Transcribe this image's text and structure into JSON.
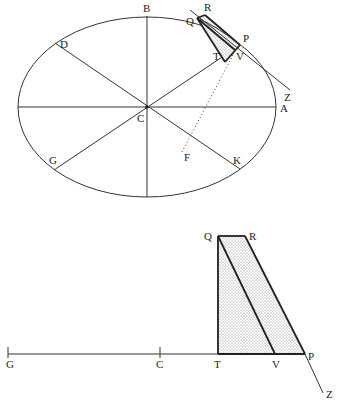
{
  "figure_top": {
    "title": "Ellipse with conjugate diameters and tangent construction",
    "labels": {
      "B": "B",
      "D": "D",
      "C": "C",
      "G": "G",
      "K": "K",
      "A": "A",
      "F": "F",
      "Q": "Q",
      "R": "R",
      "P": "P",
      "T": "T",
      "V": "V",
      "Z": "Z"
    },
    "ellipse": {
      "cx": 147,
      "cy": 107,
      "rx": 129,
      "ry": 90
    },
    "points": {
      "C": [
        147,
        107
      ],
      "A": [
        276,
        107
      ],
      "B": [
        147,
        16
      ],
      "D": [
        55,
        43
      ],
      "K": [
        240,
        169
      ],
      "G": [
        54,
        170
      ],
      "P": [
        240,
        45
      ],
      "Q": [
        197,
        18
      ],
      "R": [
        205,
        14
      ],
      "V": [
        235,
        50
      ],
      "T": [
        225,
        62
      ],
      "F": [
        182,
        152
      ],
      "Z": [
        290,
        90
      ]
    }
  },
  "figure_bottom": {
    "title": "Enlarged tangent construction",
    "labels": {
      "Q": "Q",
      "R": "R",
      "G": "G",
      "C": "C",
      "T": "T",
      "V": "V",
      "P": "P",
      "Z": "Z"
    },
    "points": {
      "G": [
        8,
        354
      ],
      "C": [
        160,
        354
      ],
      "T": [
        218,
        354
      ],
      "V": [
        275,
        354
      ],
      "P": [
        305,
        354
      ],
      "Q": [
        218,
        236
      ],
      "R": [
        245,
        236
      ],
      "Z": [
        323,
        393
      ]
    },
    "shading": "stippled"
  }
}
